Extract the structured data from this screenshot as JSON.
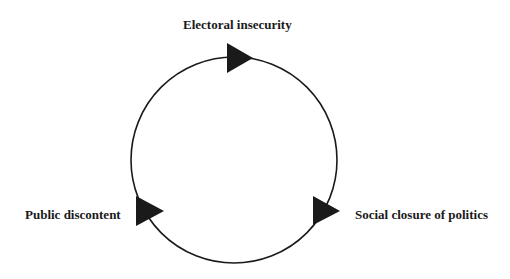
{
  "diagram": {
    "type": "cycle",
    "direction": "clockwise",
    "nodes": [
      {
        "id": "electoral-insecurity",
        "label": "Electoral insecurity",
        "position": "top"
      },
      {
        "id": "social-closure",
        "label": "Social closure of politics",
        "position": "right"
      },
      {
        "id": "public-discontent",
        "label": "Public discontent",
        "position": "left"
      }
    ],
    "edges": [
      {
        "from": "Electoral insecurity",
        "to": "Social closure of politics"
      },
      {
        "from": "Social closure of politics",
        "to": "Public discontent"
      },
      {
        "from": "Public discontent",
        "to": "Electoral insecurity"
      }
    ],
    "colors": {
      "stroke": "#1a1a1a",
      "arrow_fill": "#1a1a1a",
      "text": "#1a1a1a",
      "background": "#ffffff"
    }
  }
}
